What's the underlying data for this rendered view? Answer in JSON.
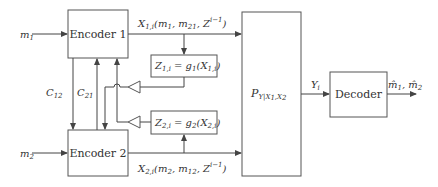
{
  "diagram": {
    "type": "block-diagram",
    "inputs": {
      "m1": {
        "base": "m",
        "sub": "1"
      },
      "m2": {
        "base": "m",
        "sub": "2"
      }
    },
    "blocks": {
      "encoder1": {
        "label": "Encoder 1"
      },
      "encoder2": {
        "label": "Encoder 2"
      },
      "z1": {
        "label": "Z",
        "sub": "1,i",
        "rest": " = g",
        "rest_sub": "1",
        "arg": "(X",
        "arg_sub": "1,i",
        "close": ")"
      },
      "z2": {
        "label": "Z",
        "sub": "2,i",
        "rest": " = g",
        "rest_sub": "2",
        "arg": "(X",
        "arg_sub": "2,i",
        "close": ")"
      },
      "channel": {
        "label": "P",
        "sub": "Y|X",
        "sub2": "1",
        "sub3": ",X",
        "sub4": "2"
      },
      "decoder": {
        "label": "Decoder"
      }
    },
    "edges": {
      "x1": {
        "base": "X",
        "sub": "1,i",
        "args": "(m",
        "a1": "1",
        "mid": ", m",
        "a2": "21",
        "tail": ", Z",
        "zsub": "2",
        "zsup": "i−1",
        "close": ")"
      },
      "x2": {
        "base": "X",
        "sub": "2,i",
        "args": "(m",
        "a1": "2",
        "mid": ", m",
        "a2": "12",
        "tail": ", Z",
        "zsub": "1",
        "zsup": "i−1",
        "close": ")"
      },
      "c12": {
        "base": "C",
        "sub": "12"
      },
      "c21": {
        "base": "C",
        "sub": "21"
      },
      "y": {
        "base": "Y",
        "sub": "i"
      },
      "output": {
        "text": "m̂",
        "s1": "1",
        "mid": ", m̂",
        "s2": "2"
      }
    }
  }
}
